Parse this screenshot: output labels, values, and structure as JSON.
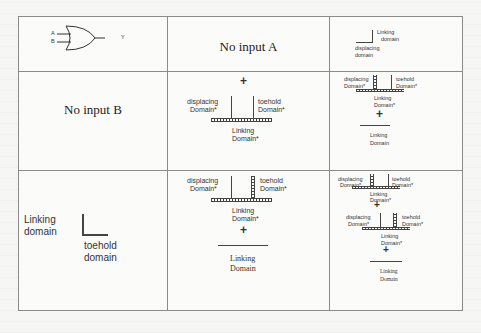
{
  "table": {
    "header_row": {
      "gate": {
        "input_a": "A",
        "input_b": "B",
        "output": "Y",
        "icon": "or-gate-icon"
      },
      "col2": "No input A",
      "col3": {
        "strand_label_1": "Linking",
        "strand_label_2": "domain",
        "strand_label_3": "displacing",
        "strand_label_4": "domain"
      }
    },
    "row2": {
      "col1": "No input B",
      "col2": {
        "plus": "+",
        "left_label_1": "displacing",
        "left_label_2": "Domain*",
        "right_label_1": "toehold",
        "right_label_2": "Domain*",
        "bottom_label_1": "Linking",
        "bottom_label_2": "Domain*"
      },
      "col3": {
        "left_label_1": "displacing",
        "left_label_2": "Domain*",
        "right_label_1": "toehold",
        "right_label_2": "Domain*",
        "bottom_label_1": "Linking",
        "bottom_label_2": "Domain*",
        "plus": "+",
        "strand_label_1": "Linking",
        "strand_label_2": "Domain"
      }
    },
    "row3": {
      "col1": {
        "label_1": "Linking",
        "label_2": "domain",
        "label_3": "toehold",
        "label_4": "domain"
      },
      "col2": {
        "left_label_1": "displacing",
        "left_label_2": "Domain*",
        "right_label_1": "toehold",
        "right_label_2": "Domain*",
        "bottom_label_1": "Linking",
        "bottom_label_2": "Domain*",
        "plus": "+",
        "strand_label_1": "Linking",
        "strand_label_2": "Domain"
      },
      "col3": {
        "top": {
          "left_label_1": "displacing",
          "left_label_2": "Domain*",
          "right_label_1": "toehold",
          "right_label_2": "Domain*",
          "bottom_label_1": "Linking",
          "bottom_label_2": "Domain*"
        },
        "plus_1": "+",
        "mid": {
          "left_label_1": "displacing",
          "left_label_2": "Domain*",
          "right_label_1": "toehold",
          "right_label_2": "Domain*",
          "bottom_label_1": "Linking",
          "bottom_label_2": "Domain*"
        },
        "plus_2": "+",
        "strand_label_1": "Linking",
        "strand_label_2": "Domain"
      }
    }
  }
}
